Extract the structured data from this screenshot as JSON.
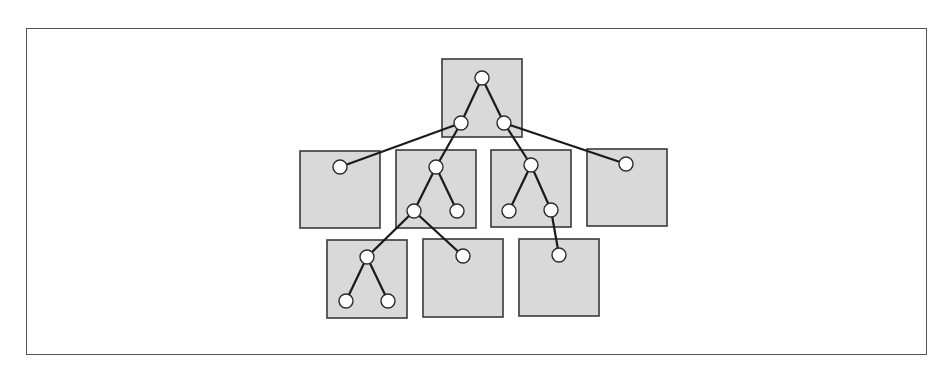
{
  "diagram": {
    "type": "tree-partitioned-into-blocks",
    "frame": {
      "x": 26,
      "y": 28,
      "width": 901,
      "height": 327,
      "stroke": "#555555"
    },
    "style": {
      "block_fill": "#d9d9d9",
      "block_stroke": "#3a3a3a",
      "edge_color": "#1a1a1a",
      "node_fill": "#ffffff",
      "node_stroke": "#2a2a2a",
      "node_radius": 7
    },
    "blocks": [
      {
        "id": "block-root",
        "x": 442,
        "y": 59,
        "w": 80,
        "h": 78
      },
      {
        "id": "block-r2-1",
        "x": 300,
        "y": 151,
        "w": 80,
        "h": 77
      },
      {
        "id": "block-r2-2",
        "x": 396,
        "y": 150,
        "w": 80,
        "h": 78
      },
      {
        "id": "block-r2-3",
        "x": 491,
        "y": 150,
        "w": 80,
        "h": 77
      },
      {
        "id": "block-r2-4",
        "x": 587,
        "y": 149,
        "w": 80,
        "h": 77
      },
      {
        "id": "block-r3-1",
        "x": 327,
        "y": 240,
        "w": 80,
        "h": 78
      },
      {
        "id": "block-r3-2",
        "x": 423,
        "y": 239,
        "w": 80,
        "h": 78
      },
      {
        "id": "block-r3-3",
        "x": 519,
        "y": 239,
        "w": 80,
        "h": 77
      }
    ],
    "nodes": [
      {
        "id": "n-root",
        "x": 482,
        "y": 78
      },
      {
        "id": "n-a",
        "x": 461,
        "y": 123
      },
      {
        "id": "n-b",
        "x": 504,
        "y": 123
      },
      {
        "id": "n-c",
        "x": 340,
        "y": 167
      },
      {
        "id": "n-d",
        "x": 436,
        "y": 167
      },
      {
        "id": "n-e",
        "x": 414,
        "y": 211
      },
      {
        "id": "n-f",
        "x": 457,
        "y": 211
      },
      {
        "id": "n-g",
        "x": 531,
        "y": 165
      },
      {
        "id": "n-h",
        "x": 509,
        "y": 211
      },
      {
        "id": "n-i",
        "x": 551,
        "y": 210
      },
      {
        "id": "n-j",
        "x": 626,
        "y": 164
      },
      {
        "id": "n-k",
        "x": 367,
        "y": 257
      },
      {
        "id": "n-l",
        "x": 346,
        "y": 301
      },
      {
        "id": "n-m",
        "x": 388,
        "y": 301
      },
      {
        "id": "n-n",
        "x": 463,
        "y": 256
      },
      {
        "id": "n-o",
        "x": 559,
        "y": 255
      }
    ],
    "edges": [
      [
        "n-root",
        "n-a"
      ],
      [
        "n-root",
        "n-b"
      ],
      [
        "n-a",
        "n-c"
      ],
      [
        "n-a",
        "n-d"
      ],
      [
        "n-b",
        "n-g"
      ],
      [
        "n-b",
        "n-j"
      ],
      [
        "n-d",
        "n-e"
      ],
      [
        "n-d",
        "n-f"
      ],
      [
        "n-g",
        "n-h"
      ],
      [
        "n-g",
        "n-i"
      ],
      [
        "n-e",
        "n-k"
      ],
      [
        "n-e",
        "n-n"
      ],
      [
        "n-i",
        "n-o"
      ],
      [
        "n-k",
        "n-l"
      ],
      [
        "n-k",
        "n-m"
      ]
    ]
  }
}
